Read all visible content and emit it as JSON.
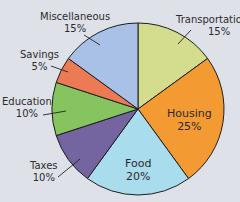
{
  "chart_data": {
    "type": "pie",
    "title": "",
    "start_angle_deg": 0,
    "direction": "clockwise",
    "categories": [
      "Transportation",
      "Housing",
      "Food",
      "Taxes",
      "Education",
      "Savings",
      "Miscellaneous"
    ],
    "values": [
      15,
      25,
      20,
      10,
      10,
      5,
      15
    ],
    "labels": [
      "15%",
      "25%",
      "20%",
      "10%",
      "10%",
      "5%",
      "15%"
    ],
    "colors": [
      "#d4dd8e",
      "#f39a32",
      "#a9dcec",
      "#7464a0",
      "#86c45f",
      "#eb7a55",
      "#a9c1e6"
    ],
    "unit": "%",
    "legend": "none"
  },
  "labels": {
    "transportation": {
      "name": "Transportation",
      "pct": "15%"
    },
    "housing": {
      "name": "Housing",
      "pct": "25%"
    },
    "food": {
      "name": "Food",
      "pct": "20%"
    },
    "taxes": {
      "name": "Taxes",
      "pct": "10%"
    },
    "education": {
      "name": "Education",
      "pct": "10%"
    },
    "savings": {
      "name": "Savings",
      "pct": "5%"
    },
    "miscellaneous": {
      "name": "Miscellaneous",
      "pct": "15%"
    }
  }
}
